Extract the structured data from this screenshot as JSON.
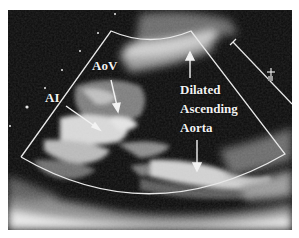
{
  "figure": {
    "type": "transesophageal-echocardiogram",
    "background_color": "#ffffff",
    "image_color": "#0a0a0a",
    "overlay_color": "#e8e8e8"
  },
  "labels": {
    "ai": "AI",
    "aov": "AoV",
    "dilated": "Dilated",
    "ascending": "Ascending",
    "aorta": "Aorta"
  },
  "annotations": [
    {
      "name": "ai-arrow",
      "from": [
        66,
        106
      ],
      "to": [
        100,
        130
      ]
    },
    {
      "name": "aov-arrow",
      "from": [
        111,
        80
      ],
      "to": [
        118,
        112
      ]
    },
    {
      "name": "ascending-up-arrow",
      "from": [
        190,
        75
      ],
      "to": [
        190,
        52
      ]
    },
    {
      "name": "aorta-down-arrow",
      "from": [
        197,
        138
      ],
      "to": [
        197,
        171
      ]
    }
  ],
  "sector": {
    "top_left": [
      111,
      31
    ],
    "top_right": [
      191,
      31
    ],
    "bottom_left": [
      21,
      157
    ],
    "bottom_right": [
      285,
      154
    ]
  },
  "depth_marker": {
    "line": [
      [
        233,
        42
      ],
      [
        292,
        104
      ]
    ],
    "plus_symbol": "+"
  }
}
